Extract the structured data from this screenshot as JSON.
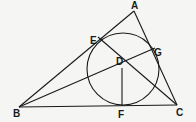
{
  "diagram": {
    "type": "geometry",
    "points": {
      "A": {
        "label": "A",
        "x": 134,
        "y": 11
      },
      "B": {
        "label": "B",
        "x": 19,
        "y": 107
      },
      "C": {
        "label": "C",
        "x": 177,
        "y": 105
      },
      "D": {
        "label": "D",
        "x": 122,
        "y": 68
      },
      "E": {
        "label": "E",
        "x": 98,
        "y": 37
      },
      "F": {
        "label": "F",
        "x": 122,
        "y": 106
      },
      "G": {
        "label": "G",
        "x": 155,
        "y": 48
      }
    },
    "circle": {
      "center": "D",
      "cx": 123,
      "cy": 69,
      "r": 36
    },
    "segments": [
      "AB",
      "BC",
      "CA",
      "BG",
      "EC",
      "DF"
    ],
    "stroke_color": "#1a1a1a"
  }
}
